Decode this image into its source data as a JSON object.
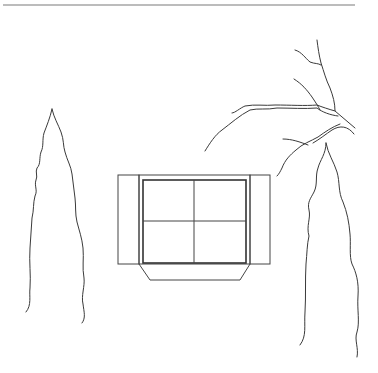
{
  "drawing": {
    "type": "line-drawing",
    "subject": "window with shutters between two cypress trees and a bare branch",
    "colors": {
      "background": "#ffffff",
      "line": "#3a3a3a",
      "top_rule": "#7a7a7a"
    },
    "elements": [
      "top-rule",
      "left-cypress-tree",
      "right-cypress-tree",
      "bare-tree-branch",
      "window-with-shutters",
      "window-sill"
    ]
  }
}
